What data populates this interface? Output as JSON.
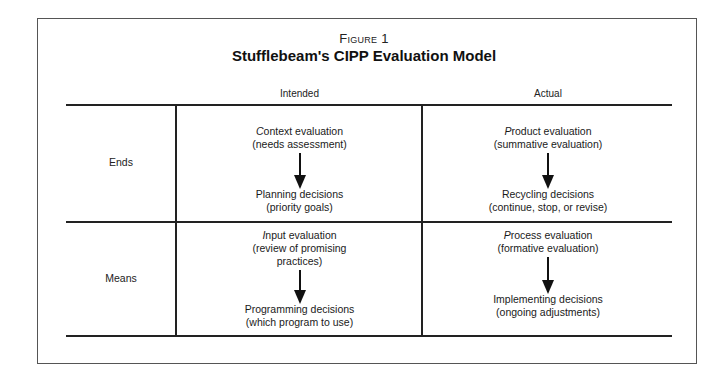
{
  "figure": {
    "label": "Figure 1",
    "title": "Stufflebeam's CIPP Evaluation Model"
  },
  "columns": [
    {
      "label": "Intended"
    },
    {
      "label": "Actual"
    }
  ],
  "rows": [
    {
      "label": "Ends",
      "cells": [
        {
          "evaluation_initial": "C",
          "evaluation_rest": "ontext evaluation",
          "evaluation_note": "(needs assessment)",
          "decision": "Planning decisions",
          "decision_note": "(priority goals)"
        },
        {
          "evaluation_initial": "P",
          "evaluation_rest": "roduct evaluation",
          "evaluation_note": "(summative evaluation)",
          "decision": "Recycling decisions",
          "decision_note": "(continue, stop, or revise)"
        }
      ]
    },
    {
      "label": "Means",
      "cells": [
        {
          "evaluation_initial": "I",
          "evaluation_rest": "nput evaluation",
          "evaluation_note_line1": "(review of promising",
          "evaluation_note_line2": "practices)",
          "decision": "Programming decisions",
          "decision_note": "(which program to use)"
        },
        {
          "evaluation_initial": "P",
          "evaluation_rest": "rocess evaluation",
          "evaluation_note": "(formative evaluation)",
          "decision": "Implementing decisions",
          "decision_note": "(ongoing adjustments)"
        }
      ]
    }
  ],
  "icons": {
    "arrow": "down-arrow"
  }
}
